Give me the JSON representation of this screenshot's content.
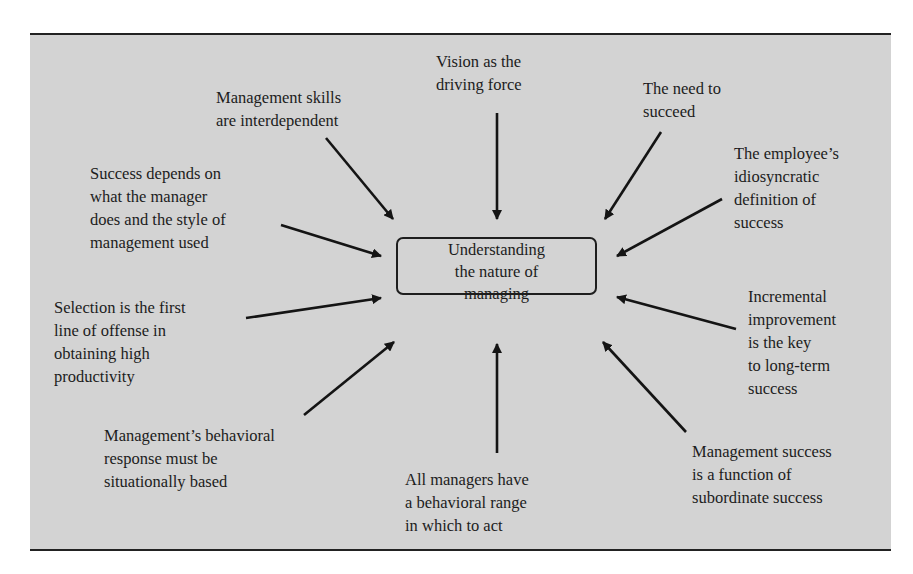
{
  "diagram": {
    "center": {
      "text": "Understanding\nthe nature of\nmanaging"
    },
    "factors": [
      {
        "id": "vision",
        "text": "Vision as the\ndriving force"
      },
      {
        "id": "need-to-succeed",
        "text": "The need to\nsucceed"
      },
      {
        "id": "employee-definition",
        "text": "The employee’s\nidiosyncratic\ndefinition of\nsuccess"
      },
      {
        "id": "incremental-improvement",
        "text": "Incremental\nimprovement\nis the key\nto long-term\nsuccess"
      },
      {
        "id": "subordinate-success",
        "text": "Management success\nis a function of\nsubordinate success"
      },
      {
        "id": "behavioral-range",
        "text": "All managers have\na behavioral range\nin which to act"
      },
      {
        "id": "situational-response",
        "text": "Management’s behavioral\nresponse must be\nsituationally based"
      },
      {
        "id": "selection",
        "text": "Selection is the first\nline of offense in\nobtaining high\nproductivity"
      },
      {
        "id": "success-depends",
        "text": "Success depends on\nwhat the manager\ndoes and the style of\nmanagement used"
      },
      {
        "id": "skills-interdependent",
        "text": "Management skills\nare interdependent"
      }
    ]
  }
}
